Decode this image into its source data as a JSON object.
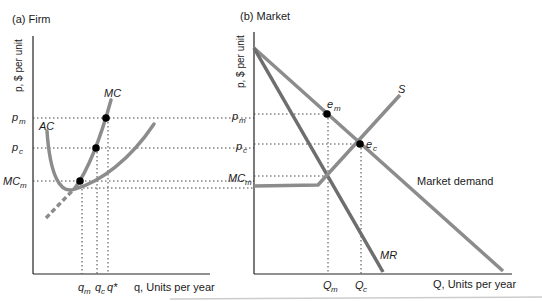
{
  "panels": {
    "firm": {
      "title": "(a) Firm",
      "ylabel": "p, $ per unit",
      "xlabel": "q, Units per year",
      "price_labels": {
        "pm": "p",
        "pm_sub": "m",
        "pc": "p",
        "pc_sub": "c",
        "mcm": "MC",
        "mcm_sub": "m"
      },
      "curve_labels": {
        "mc": "MC",
        "ac": "AC"
      },
      "q_labels": {
        "qm": "q",
        "qm_sub": "m",
        "qc": "q",
        "qc_sub": "c",
        "qstar": "q*"
      }
    },
    "market": {
      "title": "(b) Market",
      "ylabel": "p, $ per unit",
      "xlabel": "Q, Units per year",
      "price_labels": {
        "pm": "p",
        "pm_sub": "m",
        "pc": "p",
        "pc_sub": "c",
        "mcm": "MC",
        "mcm_sub": "m"
      },
      "curve_labels": {
        "s": "S",
        "demand": "Market demand",
        "mr": "MR"
      },
      "point_labels": {
        "em": "e",
        "em_sub": "m",
        "ec": "e",
        "ec_sub": "c"
      },
      "q_labels": {
        "Qm": "Q",
        "Qm_sub": "m",
        "Qc": "Q",
        "Qc_sub": "c"
      }
    }
  },
  "colors": {
    "curve": "#8c8c8c",
    "curve_dark": "#6e6e6e",
    "axis": "#222222",
    "point": "#000000",
    "dotted": "#444444"
  }
}
